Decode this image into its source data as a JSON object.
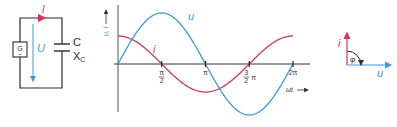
{
  "colors": {
    "voltage": "#3a9bd5",
    "current": "#d6335e",
    "wire": "#2b2b2b",
    "axis": "#333333"
  },
  "circuit": {
    "generator_label": "G",
    "generator_symbol": "~",
    "voltage_label": "U",
    "current_label": "I",
    "capacitor_label": "C",
    "reactance_label": "X",
    "reactance_subscript": "C"
  },
  "chart_data": {
    "type": "line",
    "title": "",
    "ylabel": "u, i",
    "xlabel": "ωt",
    "x_ticks": [
      {
        "value": 1.5708,
        "num": "π",
        "den": "2",
        "label": "π/2"
      },
      {
        "value": 3.1416,
        "label": "π"
      },
      {
        "value": 4.7124,
        "num": "3",
        "den": "2",
        "suffix": "π",
        "label": "3/2 π"
      },
      {
        "value": 6.2832,
        "label": "2π"
      }
    ],
    "xlim": [
      0,
      6.2832
    ],
    "ylim": [
      -1.1,
      1.25
    ],
    "series": [
      {
        "name": "u",
        "label": "u",
        "function": "sin",
        "amplitude": 1.0,
        "phase": 0,
        "color_key": "voltage"
      },
      {
        "name": "i",
        "label": "i",
        "function": "cos",
        "amplitude": 0.55,
        "phase": 1.5708,
        "color_key": "current"
      }
    ],
    "grid": false
  },
  "phasor": {
    "voltage_label": "u",
    "current_label": "i",
    "angle_label": "φ",
    "angle_deg": 90
  }
}
